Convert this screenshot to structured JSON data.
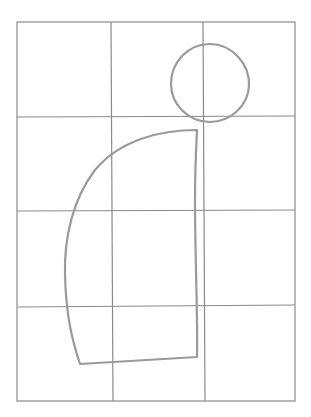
{
  "drawing": {
    "description": "Pencil sketch on a 3x4 grid: a circle (head) in the upper right and a curved quarter-shape body below",
    "grid": {
      "columns": 3,
      "rows": 4,
      "line_color": "#8a8a8a"
    },
    "shapes": [
      {
        "name": "circle",
        "color": "#9a9a9a"
      },
      {
        "name": "curved-body",
        "color": "#9a9a9a"
      }
    ]
  }
}
